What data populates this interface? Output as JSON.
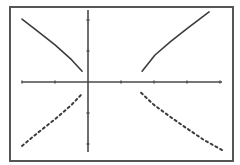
{
  "colors": {
    "background": "#ffffff",
    "frame": "#555555",
    "axis": "#4a4a4a",
    "curve": "#3c3c3c"
  },
  "chart_data": {
    "type": "line",
    "title": "",
    "xlabel": "",
    "ylabel": "",
    "grid": false,
    "legend": null,
    "xlim": [
      -2.0,
      4.1
    ],
    "ylim": [
      -2.4,
      2.4
    ],
    "x_ticks": [
      -2,
      -1,
      0,
      1,
      2,
      3,
      4
    ],
    "y_ticks": [
      -2,
      -1,
      1,
      2
    ],
    "tick_labels_shown": false,
    "series": [
      {
        "name": "upper-left branch",
        "style": "solid",
        "points": [
          [
            -2.0,
            2.03
          ],
          [
            -1.5,
            1.62
          ],
          [
            -1.0,
            1.2
          ],
          [
            -0.5,
            0.72
          ],
          [
            -0.18,
            0.35
          ]
        ]
      },
      {
        "name": "upper-right branch",
        "style": "solid",
        "points": [
          [
            1.64,
            0.35
          ],
          [
            2.03,
            0.87
          ],
          [
            2.5,
            1.3
          ],
          [
            3.0,
            1.72
          ],
          [
            3.67,
            2.26
          ]
        ]
      },
      {
        "name": "lower-left branch",
        "style": "dotted",
        "points": [
          [
            -2.0,
            -2.06
          ],
          [
            -1.5,
            -1.62
          ],
          [
            -1.0,
            -1.2
          ],
          [
            -0.5,
            -0.74
          ],
          [
            -0.15,
            -0.35
          ]
        ]
      },
      {
        "name": "lower-right branch",
        "style": "dotted",
        "points": [
          [
            1.61,
            -0.35
          ],
          [
            2.0,
            -0.74
          ],
          [
            2.5,
            -1.13
          ],
          [
            3.0,
            -1.5
          ],
          [
            3.5,
            -1.86
          ],
          [
            4.12,
            -2.23
          ]
        ]
      }
    ]
  },
  "layout": {
    "frame": {
      "x": 10,
      "y": 7,
      "w": 223,
      "h": 154
    },
    "origin_px": [
      88,
      82
    ],
    "x_unit_px": 33,
    "y_unit_px": 31,
    "x_axis_px": [
      22,
      222
    ],
    "y_axis_px": [
      10,
      152
    ]
  }
}
